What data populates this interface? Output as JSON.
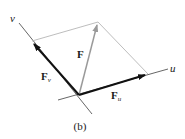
{
  "figure": {
    "caption": "(b)",
    "axes": {
      "v": {
        "label": "v"
      },
      "u": {
        "label": "u"
      }
    },
    "vectors": {
      "F": {
        "label": "F",
        "subscript": ""
      },
      "Fv": {
        "label": "F",
        "subscript": "v"
      },
      "Fu": {
        "label": "F",
        "subscript": "u"
      }
    },
    "colors": {
      "axis": "#555555",
      "resultant": "#9a9a9a",
      "component": "#111111",
      "construction": "#b5b5b5"
    }
  }
}
